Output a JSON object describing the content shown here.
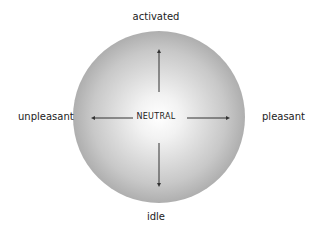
{
  "diagram": {
    "type": "affect-circumplex",
    "center_label": "NEUTRAL",
    "axes": {
      "top": "activated",
      "bottom": "idle",
      "left": "unpleasant",
      "right": "pleasant"
    },
    "colors": {
      "circle_center": "#ffffff",
      "circle_edge": "#7a7a7a",
      "arrow": "#333333",
      "text": "#222222"
    }
  }
}
